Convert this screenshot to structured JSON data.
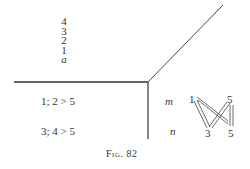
{
  "figure": {
    "caption": "Fig. 82",
    "stack_labels": [
      "4",
      "3",
      "2",
      "1",
      "a"
    ],
    "row_labels": {
      "upper": "1; 2 > 5",
      "lower": "3; 4 > 5"
    },
    "row_vars": {
      "upper": "m",
      "lower": "n"
    },
    "graph_nodes": {
      "top_left": "1",
      "top_right": "5",
      "bottom_left": "3",
      "bottom_right": "5"
    },
    "lines": {
      "horizontal": {
        "x1": 14,
        "y1": 82,
        "x2": 148,
        "y2": 82
      },
      "diagonal": {
        "x1": 148,
        "y1": 82,
        "x2": 223,
        "y2": 5
      },
      "vertical": {
        "x1": 148,
        "y1": 82,
        "x2": 148,
        "y2": 139
      }
    },
    "colors": {
      "ink": "#333333",
      "background": "#ffffff"
    }
  }
}
